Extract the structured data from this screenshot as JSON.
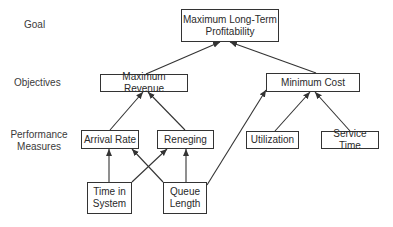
{
  "levels": {
    "goal": "Goal",
    "objectives": "Objectives",
    "performance": "Performance\nMeasures"
  },
  "nodes": {
    "goal": "Maximum Long-Term\nProfitability",
    "max_revenue": "Maximum Revenue",
    "min_cost": "Minimum Cost",
    "arrival_rate": "Arrival Rate",
    "reneging": "Reneging",
    "utilization": "Utilization",
    "service_time": "Service Time",
    "time_in_system": "Time in\nSystem",
    "queue_length": "Queue\nLength"
  },
  "edges": [
    {
      "from": "max_revenue",
      "to": "goal"
    },
    {
      "from": "min_cost",
      "to": "goal"
    },
    {
      "from": "arrival_rate",
      "to": "max_revenue"
    },
    {
      "from": "reneging",
      "to": "max_revenue"
    },
    {
      "from": "utilization",
      "to": "min_cost"
    },
    {
      "from": "service_time",
      "to": "min_cost"
    },
    {
      "from": "time_in_system",
      "to": "arrival_rate"
    },
    {
      "from": "time_in_system",
      "to": "reneging"
    },
    {
      "from": "queue_length",
      "to": "arrival_rate"
    },
    {
      "from": "queue_length",
      "to": "reneging"
    },
    {
      "from": "queue_length",
      "to": "min_cost"
    }
  ]
}
